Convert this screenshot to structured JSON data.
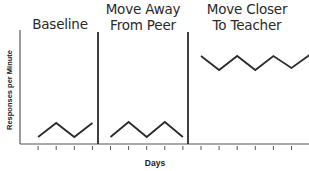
{
  "chart_data": {
    "type": "line",
    "title": "",
    "xlabel": "Days",
    "ylabel": "Responses per Minute",
    "grid": false,
    "legend": null,
    "ylim": [
      0,
      114
    ],
    "phases": [
      {
        "name": "Baseline",
        "title_lines": [
          "Baseline"
        ],
        "x": [
          1,
          2,
          3,
          4
        ],
        "values": [
          7,
          21,
          7,
          21
        ]
      },
      {
        "name": "Move Away From Peer",
        "title_lines": [
          "Move Away",
          "From Peer"
        ],
        "x": [
          5,
          6,
          7,
          8,
          9
        ],
        "values": [
          7,
          22,
          7,
          22,
          7
        ]
      },
      {
        "name": "Move Closer To Teacher",
        "title_lines": [
          "Move Closer",
          "To Teacher"
        ],
        "x": [
          10,
          11,
          12,
          13,
          14,
          15,
          16
        ],
        "values": [
          88,
          74,
          88,
          74,
          88,
          76,
          89
        ]
      }
    ],
    "phase_change_lines_after_day": [
      4.5,
      9.5
    ],
    "annotations": "Single-subject reversal-style design; y-axis has no numeric tick labels"
  },
  "colors": {
    "line": "#2b2b2b",
    "axis": "#555555",
    "divider": "#2b2b2b",
    "text": "#2a2a2a"
  }
}
